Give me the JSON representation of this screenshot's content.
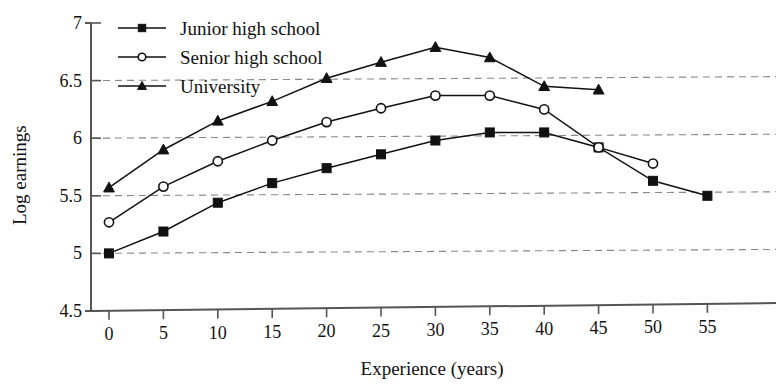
{
  "chart_data": {
    "type": "line",
    "title": "",
    "xlabel": "Experience (years)",
    "ylabel": "Log earnings",
    "xlim": [
      0,
      57
    ],
    "ylim": [
      4.5,
      7
    ],
    "xticks": [
      0,
      5,
      10,
      15,
      20,
      25,
      30,
      35,
      40,
      45,
      50,
      55
    ],
    "yticks": [
      4.5,
      5,
      5.5,
      6,
      6.5,
      7
    ],
    "grid": "horizontal-dashed",
    "legend_position": "top-left-inside",
    "series": [
      {
        "name": "Junior high school",
        "marker": "filled-square",
        "x": [
          0,
          5,
          10,
          15,
          20,
          25,
          30,
          35,
          40,
          45,
          50,
          55
        ],
        "values": [
          5.0,
          5.19,
          5.44,
          5.61,
          5.74,
          5.86,
          5.98,
          6.05,
          6.05,
          5.92,
          5.63,
          5.5
        ]
      },
      {
        "name": "Senior high school",
        "marker": "open-circle",
        "x": [
          0,
          5,
          10,
          15,
          20,
          25,
          30,
          35,
          40,
          45,
          50
        ],
        "values": [
          5.27,
          5.58,
          5.8,
          5.98,
          6.14,
          6.26,
          6.37,
          6.37,
          6.25,
          5.92,
          5.78
        ]
      },
      {
        "name": "University",
        "marker": "filled-triangle",
        "x": [
          0,
          5,
          10,
          15,
          20,
          25,
          30,
          35,
          40,
          45
        ],
        "values": [
          5.57,
          5.9,
          6.15,
          6.32,
          6.52,
          6.66,
          6.79,
          6.7,
          6.45,
          6.42
        ]
      }
    ]
  },
  "axes": {
    "y_title": "Log earnings",
    "x_title": "Experience (years)",
    "y_tick_labels": [
      "7",
      "6.5",
      "6",
      "5.5",
      "5",
      "4.5"
    ],
    "x_tick_labels": [
      "0",
      "5",
      "10",
      "15",
      "20",
      "25",
      "30",
      "35",
      "40",
      "45",
      "50",
      "55"
    ]
  },
  "legend": {
    "items": [
      {
        "label": "Junior high school",
        "marker": "filled-square"
      },
      {
        "label": "Senior high school",
        "marker": "open-circle"
      },
      {
        "label": "University",
        "marker": "filled-triangle"
      }
    ]
  },
  "colors": {
    "ink": "#111111",
    "grid": "#888888",
    "axis": "#555555",
    "background": "#ffffff"
  }
}
